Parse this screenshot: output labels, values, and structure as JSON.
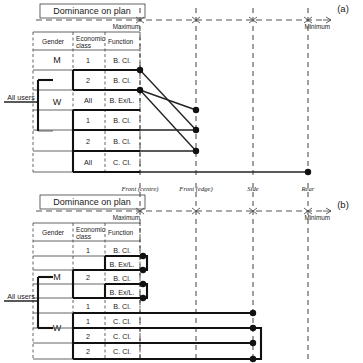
{
  "figure": {
    "title_box_label": "Dominance on plan",
    "scale_max_label": "Maximum",
    "scale_min_label": "Minimum",
    "root_label": "All users",
    "panel_a_label": "(a)",
    "panel_b_label": "(b)",
    "columns": [
      "Gender",
      "Economic class",
      "Function"
    ],
    "column_header_lines": {
      "gender": [
        "Gender"
      ],
      "economic": [
        "Economic",
        "class"
      ],
      "function": [
        "Function"
      ]
    },
    "axis_categories": [
      "Front (centre)",
      "Front (edge)",
      "Side",
      "Rear"
    ],
    "axis_positions_px": [
      140,
      196,
      253,
      308
    ]
  },
  "panel_a": {
    "label": "(a)",
    "rows": [
      {
        "gender": "M",
        "economic": "1",
        "function": "B. Cl.",
        "dot_x": 140
      },
      {
        "gender": "M",
        "economic": "2",
        "function": "B. Cl.",
        "dot_x": 196
      },
      {
        "gender": "W",
        "economic": "All",
        "function": "B. Ex/L.",
        "dot_x": 140
      },
      {
        "gender": "W",
        "economic": "1",
        "function": "B. Cl.",
        "dot_x": 196
      },
      {
        "gender": "W",
        "economic": "2",
        "function": "B. Cl.",
        "dot_x": 196
      },
      {
        "gender": "W",
        "economic": "All",
        "function": "C. Cl.",
        "dot_x": 308
      }
    ]
  },
  "panel_b": {
    "label": "(b)",
    "rows": [
      {
        "gender": "M",
        "economic": "1",
        "function": "B. Cl.",
        "dot_x": 140
      },
      {
        "gender": "M",
        "economic": "1",
        "function": "B. Ex/L.",
        "dot_x": 140
      },
      {
        "gender": "M",
        "economic": "2",
        "function": "B. Cl.",
        "dot_x": 140
      },
      {
        "gender": "M",
        "economic": "2",
        "function": "B. Ex/L.",
        "dot_x": 140
      },
      {
        "gender": "W",
        "economic": "1",
        "function": "B. Cl.",
        "dot_x": 253
      },
      {
        "gender": "W",
        "economic": "1",
        "function": "C. Cl.",
        "dot_x": 253
      },
      {
        "gender": "W",
        "economic": "2",
        "function": "C. Cl.",
        "dot_x": 253
      },
      {
        "gender": "W",
        "economic": "2",
        "function": "C. Cl.",
        "dot_x": 253
      }
    ]
  }
}
